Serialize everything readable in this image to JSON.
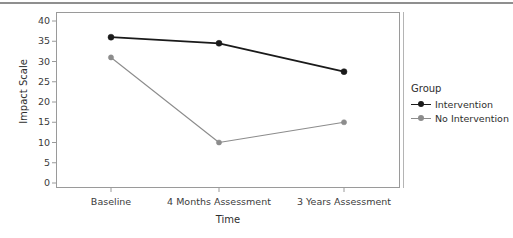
{
  "chart_data": {
    "type": "line",
    "title": "",
    "xlabel": "Time",
    "ylabel": "Impact Scale",
    "categories": [
      "Baseline",
      "4 Months Assessment",
      "3 Years Assessment"
    ],
    "ylim": [
      0,
      42
    ],
    "yticks": [
      0,
      5,
      10,
      15,
      20,
      25,
      30,
      35,
      40
    ],
    "ytick_labels": [
      "0",
      "5",
      "10",
      "15",
      "20",
      "25",
      "30",
      "35",
      "40"
    ],
    "grid": false,
    "legend_position": "right",
    "series": [
      {
        "name": "Intervention",
        "values": [
          36,
          34.5,
          27.5
        ],
        "color": "#1a1a1a",
        "marker": "circle"
      },
      {
        "name": "No Intervention",
        "values": [
          31,
          10,
          15
        ],
        "color": "#8c8c8c",
        "marker": "circle"
      }
    ]
  },
  "legend": {
    "title": "Group",
    "entries": [
      {
        "label": "Intervention",
        "color": "#1a1a1a"
      },
      {
        "label": "No Intervention",
        "color": "#8c8c8c"
      }
    ]
  },
  "axes": {
    "x_title": "Time",
    "y_title": "Impact Scale"
  },
  "colors": {
    "intervention": "#1a1a1a",
    "no_intervention": "#8c8c8c",
    "frame": "#9a9a9a",
    "text": "#2e2e2e"
  }
}
